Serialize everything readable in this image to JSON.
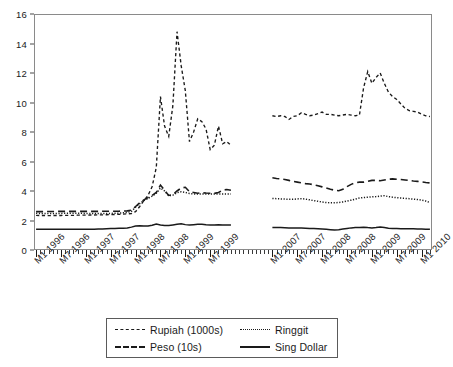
{
  "chart_data": {
    "type": "line",
    "title": "",
    "xlabel": "",
    "ylabel": "",
    "ylim": [
      0,
      16
    ],
    "y_ticks": [
      0,
      2,
      4,
      6,
      8,
      10,
      12,
      14,
      16
    ],
    "grid": false,
    "legend_position": "bottom",
    "note": "Two disjoint time panels separated by a gap: 1996-M1 to 1999-M12 and 2007-M1 to 2010-M3",
    "x_tick_labels": [
      "M1 1996",
      "M7 1996",
      "M1 1997",
      "M7 1997",
      "M1 1998",
      "M7 1998",
      "M1 1999",
      "M7 1999",
      "M1 2007",
      "M7 2007",
      "M1 2008",
      "M7 2008",
      "M1 2009",
      "M7 2009",
      "M1 2010"
    ],
    "panels": [
      {
        "name": "panel-1996-1999",
        "x_start": "M1 1996",
        "x_end": "M12 1999",
        "n_points": 48,
        "series": [
          {
            "name": "Rupiah (1000s)",
            "style": "short-dash",
            "values": [
              2.35,
              2.34,
              2.34,
              2.33,
              2.34,
              2.34,
              2.34,
              2.35,
              2.35,
              2.35,
              2.36,
              2.36,
              2.36,
              2.37,
              2.37,
              2.38,
              2.38,
              2.39,
              2.4,
              2.41,
              2.42,
              2.43,
              2.45,
              2.47,
              2.6,
              2.95,
              3.35,
              3.7,
              4.3,
              5.6,
              10.4,
              8.4,
              7.7,
              9.8,
              14.8,
              12.5,
              10.8,
              7.35,
              8.0,
              8.9,
              8.7,
              8.2,
              6.8,
              7.1,
              8.4,
              7.2,
              7.35,
              7.1
            ]
          },
          {
            "name": "Peso (10s)",
            "style": "long-dash",
            "values": [
              2.6,
              2.6,
              2.6,
              2.61,
              2.61,
              2.62,
              2.62,
              2.62,
              2.62,
              2.62,
              2.62,
              2.62,
              2.62,
              2.62,
              2.62,
              2.62,
              2.63,
              2.63,
              2.63,
              2.63,
              2.63,
              2.64,
              2.65,
              2.7,
              2.95,
              3.2,
              3.4,
              3.55,
              3.7,
              3.9,
              4.4,
              4.05,
              3.7,
              3.75,
              4.0,
              4.2,
              4.25,
              3.95,
              3.9,
              3.85,
              3.88,
              3.86,
              3.85,
              3.84,
              3.9,
              4.05,
              4.1,
              4.05
            ]
          },
          {
            "name": "Ringgit",
            "style": "dotted",
            "values": [
              2.5,
              2.48,
              2.48,
              2.48,
              2.48,
              2.48,
              2.48,
              2.49,
              2.49,
              2.49,
              2.49,
              2.49,
              2.48,
              2.48,
              2.47,
              2.47,
              2.47,
              2.47,
              2.48,
              2.49,
              2.5,
              2.52,
              2.55,
              2.62,
              2.9,
              3.15,
              3.35,
              3.5,
              3.65,
              3.85,
              4.2,
              4.0,
              3.68,
              3.72,
              3.88,
              3.95,
              3.9,
              3.83,
              3.8,
              3.8,
              3.8,
              3.8,
              3.8,
              3.8,
              3.8,
              3.8,
              3.8,
              3.8
            ]
          },
          {
            "name": "Sing Dollar",
            "style": "solid",
            "values": [
              1.4,
              1.4,
              1.4,
              1.4,
              1.4,
              1.4,
              1.4,
              1.41,
              1.41,
              1.41,
              1.41,
              1.41,
              1.41,
              1.41,
              1.41,
              1.42,
              1.43,
              1.44,
              1.45,
              1.46,
              1.47,
              1.48,
              1.5,
              1.55,
              1.62,
              1.65,
              1.63,
              1.62,
              1.68,
              1.76,
              1.7,
              1.66,
              1.66,
              1.7,
              1.74,
              1.78,
              1.72,
              1.7,
              1.72,
              1.74,
              1.75,
              1.72,
              1.7,
              1.7,
              1.71,
              1.7,
              1.7,
              1.7
            ]
          }
        ]
      },
      {
        "name": "panel-2007-2010",
        "x_start": "M1 2007",
        "x_end": "M3 2010",
        "n_points": 39,
        "series": [
          {
            "name": "Rupiah (1000s)",
            "style": "short-dash",
            "values": [
              9.1,
              9.05,
              9.1,
              9.05,
              8.85,
              9.05,
              9.1,
              9.3,
              9.2,
              9.1,
              9.15,
              9.25,
              9.35,
              9.2,
              9.2,
              9.15,
              9.1,
              9.15,
              9.2,
              9.15,
              9.1,
              9.15,
              11.0,
              12.1,
              11.3,
              11.7,
              12.0,
              11.3,
              10.7,
              10.4,
              10.2,
              9.9,
              9.6,
              9.45,
              9.4,
              9.35,
              9.2,
              9.1,
              9.05
            ]
          },
          {
            "name": "Peso (10s)",
            "style": "long-dash",
            "values": [
              4.9,
              4.85,
              4.82,
              4.78,
              4.72,
              4.65,
              4.6,
              4.55,
              4.5,
              4.48,
              4.42,
              4.35,
              4.28,
              4.2,
              4.12,
              4.05,
              4.02,
              4.12,
              4.3,
              4.45,
              4.55,
              4.6,
              4.6,
              4.65,
              4.72,
              4.72,
              4.7,
              4.75,
              4.8,
              4.82,
              4.8,
              4.78,
              4.75,
              4.72,
              4.68,
              4.65,
              4.62,
              4.58,
              4.55
            ]
          },
          {
            "name": "Ringgit",
            "style": "dotted",
            "values": [
              3.5,
              3.48,
              3.46,
              3.45,
              3.44,
              3.44,
              3.46,
              3.48,
              3.45,
              3.4,
              3.35,
              3.3,
              3.25,
              3.22,
              3.2,
              3.2,
              3.22,
              3.26,
              3.32,
              3.38,
              3.45,
              3.52,
              3.56,
              3.58,
              3.6,
              3.62,
              3.65,
              3.68,
              3.62,
              3.58,
              3.55,
              3.52,
              3.5,
              3.48,
              3.45,
              3.42,
              3.38,
              3.32,
              3.22
            ]
          },
          {
            "name": "Sing Dollar",
            "style": "solid",
            "values": [
              1.52,
              1.52,
              1.52,
              1.51,
              1.5,
              1.5,
              1.5,
              1.5,
              1.48,
              1.46,
              1.45,
              1.44,
              1.42,
              1.4,
              1.38,
              1.36,
              1.38,
              1.42,
              1.46,
              1.5,
              1.52,
              1.53,
              1.55,
              1.52,
              1.5,
              1.52,
              1.56,
              1.52,
              1.48,
              1.46,
              1.45,
              1.44,
              1.44,
              1.44,
              1.44,
              1.43,
              1.42,
              1.41,
              1.4
            ]
          }
        ]
      }
    ],
    "legend": [
      {
        "label": "Rupiah (1000s)",
        "style": "short-dash"
      },
      {
        "label": "Ringgit",
        "style": "dotted"
      },
      {
        "label": "Peso (10s)",
        "style": "long-dash"
      },
      {
        "label": "Sing Dollar",
        "style": "solid"
      }
    ]
  },
  "colors": {
    "ink": "#1a1a1a",
    "axis": "#8a8a8a",
    "background": "#ffffff"
  }
}
